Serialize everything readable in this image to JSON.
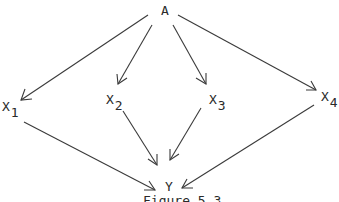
{
  "diagram": {
    "type": "directed-graph",
    "nodes": {
      "A": {
        "label": "A",
        "sub": ""
      },
      "X1": {
        "label": "X",
        "sub": "1"
      },
      "X2": {
        "label": "X",
        "sub": "2"
      },
      "X3": {
        "label": "X",
        "sub": "3"
      },
      "X4": {
        "label": "X",
        "sub": "4"
      },
      "Y": {
        "label": "Y",
        "sub": ""
      }
    },
    "edges": [
      {
        "from": "A",
        "to": "X1"
      },
      {
        "from": "A",
        "to": "X2"
      },
      {
        "from": "A",
        "to": "X3"
      },
      {
        "from": "A",
        "to": "X4"
      },
      {
        "from": "X1",
        "to": "Y"
      },
      {
        "from": "X2",
        "to": "Y"
      },
      {
        "from": "X3",
        "to": "Y"
      },
      {
        "from": "X4",
        "to": "Y"
      }
    ],
    "caption": "Figure 5.3",
    "colors": {
      "stroke": "#3a3a3a",
      "text": "#2a2a2a",
      "background": "#ffffff"
    }
  }
}
